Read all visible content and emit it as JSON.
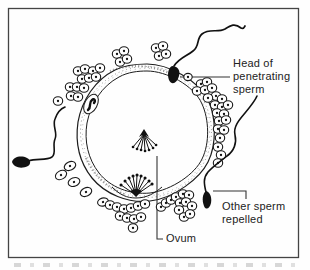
{
  "figure": {
    "labels": {
      "penetrating_sperm": "Head of penetrating sperm",
      "other_sperm": "Other sperm repelled",
      "ovum": "Ovum"
    },
    "colors": {
      "ink": "#1c1c1c",
      "paper": "#fefefe",
      "frame": "#444444",
      "leader_line": "#333333"
    }
  }
}
